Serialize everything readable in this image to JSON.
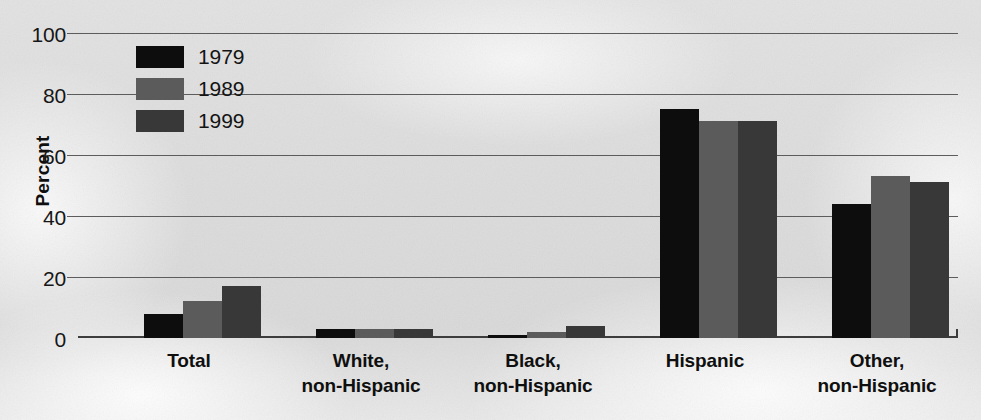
{
  "chart_data": {
    "type": "bar",
    "title": "",
    "subtitle": "",
    "xlabel": "",
    "ylabel": "Percent",
    "ylim": [
      0,
      100
    ],
    "ytick_values": [
      100,
      80,
      60,
      40,
      20,
      0
    ],
    "ytick_labels": [
      "100",
      "80",
      "60",
      "40",
      "20",
      "0"
    ],
    "grid": "horizontal",
    "legend_position": "upper-left-inside",
    "categories": [
      "Total",
      "White, non-Hispanic",
      "Black, non-Hispanic",
      "Hispanic",
      "Other, non-Hispanic"
    ],
    "category_lines": [
      [
        "Total"
      ],
      [
        "White,",
        "non-Hispanic"
      ],
      [
        "Black,",
        "non-Hispanic"
      ],
      [
        "Hispanic"
      ],
      [
        "Other,",
        "non-Hispanic"
      ]
    ],
    "series": [
      {
        "name": "1979",
        "color": "#0d0d0d",
        "values": [
          8,
          3,
          1,
          75,
          44
        ]
      },
      {
        "name": "1989",
        "color": "#5b5b5b",
        "values": [
          12,
          3,
          2,
          71,
          53
        ]
      },
      {
        "name": "1999",
        "color": "#383838",
        "values": [
          17,
          3,
          4,
          71,
          51
        ]
      }
    ]
  },
  "legend": {
    "entries": [
      {
        "label": "1979",
        "color": "#0d0d0d"
      },
      {
        "label": "1989",
        "color": "#5b5b5b"
      },
      {
        "label": "1999",
        "color": "#383838"
      }
    ]
  },
  "axes": {
    "y_title": "Percent",
    "y_ticks": [
      "100",
      "80",
      "60",
      "40",
      "20",
      "0"
    ]
  },
  "colors": {
    "background": "#dcdcdc",
    "gridline": "#5c5c5c",
    "axis": "#3d3d3d",
    "text": "#0f0f0f",
    "series_1979": "#0d0d0d",
    "series_1989": "#5b5b5b",
    "series_1999": "#383838"
  }
}
